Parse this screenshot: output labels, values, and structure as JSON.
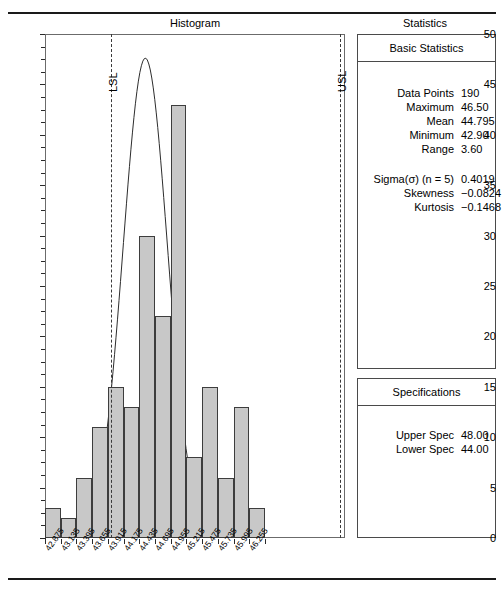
{
  "document": {
    "histogram_panel_title": "Histogram",
    "statistics_panel_title": "Statistics"
  },
  "chart_data": {
    "type": "bar",
    "title": "Histogram",
    "xlabel": "",
    "ylabel": "",
    "ylim": [
      0,
      50
    ],
    "ytick_step": 5,
    "yticks": [
      "0",
      "5",
      "10",
      "15",
      "20",
      "25",
      "30",
      "35",
      "40",
      "45",
      "50"
    ],
    "grid": false,
    "legend": "none",
    "categories": [
      "42.875",
      "43.135",
      "43.395",
      "43.655",
      "43.915",
      "44.175",
      "44.435",
      "44.695",
      "44.955",
      "45.215",
      "45.475",
      "45.735",
      "45.995",
      "46.255"
    ],
    "values": [
      3,
      2,
      6,
      11,
      15,
      13,
      30,
      22,
      43,
      8,
      15,
      6,
      13,
      3
    ],
    "annotations": [
      {
        "label": "LSL",
        "value": 44.0,
        "style": "dashed-vertical"
      },
      {
        "label": "USL",
        "value": 48.0,
        "style": "dashed-vertical"
      }
    ],
    "overlay": {
      "name": "normal-curve",
      "mean": 44.795,
      "sigma": 0.4019,
      "peak_value": 47.7
    }
  },
  "statistics": {
    "basic": {
      "header": "Basic Statistics",
      "rows": [
        {
          "label": "Data Points",
          "value": "190"
        },
        {
          "label": "Maximum",
          "value": "46.50"
        },
        {
          "label": "Mean",
          "value": "44.795"
        },
        {
          "label": "Minimum",
          "value": "42.90"
        },
        {
          "label": "Range",
          "value": "3.60"
        }
      ],
      "rows2": [
        {
          "label": "Sigma(σ) (n = 5)",
          "value": "0.4019"
        },
        {
          "label": "Skewness",
          "value": "−0.0824"
        },
        {
          "label": "Kurtosis",
          "value": "−0.1468"
        }
      ]
    },
    "specifications": {
      "header": "Specifications",
      "rows": [
        {
          "label": "Upper Spec",
          "value": "48.00"
        },
        {
          "label": "Lower Spec",
          "value": "44.00"
        }
      ]
    }
  },
  "colors": {
    "bar_fill": "#c8c8c8",
    "bar_stroke": "#3d3d3d",
    "axis": "#4a4a4a",
    "rule": "#1a1a1a"
  }
}
